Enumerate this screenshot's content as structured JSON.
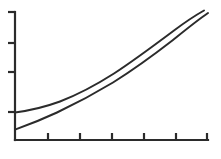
{
  "chart_data": {
    "type": "line",
    "title": "",
    "subtitle": "",
    "xlabel": "",
    "ylabel": "",
    "grid": false,
    "legend": false,
    "legend_position": "none",
    "xlim": [
      0,
      6
    ],
    "ylim": [
      0,
      4
    ],
    "x_tick_labels": [
      "",
      "",
      "",
      "",
      "",
      ""
    ],
    "y_tick_labels": [
      "",
      "",
      "",
      ""
    ],
    "x_tick_values": [
      1,
      2,
      3,
      4,
      5,
      6
    ],
    "y_tick_values": [
      1,
      2,
      3,
      4
    ],
    "x": [
      0,
      0.5,
      1,
      1.5,
      2,
      2.5,
      3,
      3.5,
      4,
      4.5,
      5,
      5.5,
      6
    ],
    "series": [
      {
        "name": "curve-upper",
        "color": "#2b2b2b",
        "width": 2.0,
        "values": [
          0.88,
          0.93,
          1.0,
          1.12,
          1.3,
          1.55,
          1.86,
          2.23,
          2.64,
          3.08,
          3.54,
          4.0,
          4.42
        ]
      },
      {
        "name": "curve-lower",
        "color": "#2b2b2b",
        "width": 2.0,
        "values": [
          0.33,
          0.46,
          0.62,
          0.8,
          1.02,
          1.28,
          1.58,
          1.93,
          2.32,
          2.75,
          3.2,
          3.66,
          4.1
        ]
      }
    ],
    "annotations": []
  },
  "geometry": {
    "plot_left": 15,
    "plot_right": 208,
    "plot_top": 12,
    "plot_bottom": 140,
    "axis_color": "#2b2b2b",
    "background": "#ffffff",
    "y_axis_tick_px": [
      12,
      43,
      72,
      112
    ],
    "x_axis_tick_px": [
      48,
      80,
      112,
      144,
      176,
      207
    ],
    "tick_length": 7
  },
  "series_paths": {
    "upper": "M 15 112.4 C 30 110.6, 45 107.0, 60 101.5 C 78 94.5, 96 85.0, 114 73.5 C 134 60.5, 154 45.5, 174 30.5 C 186 21.5, 196 15.0, 204 10.5",
    "lower": "M 15 129.6 C 28 125.0, 42 119.5, 57 112.5 C 75 104.0, 94 94.0, 113 82.5 C 133 70.0, 153 55.5, 173 40.0 C 186 29.5, 197 20.5, 208 13.0"
  }
}
